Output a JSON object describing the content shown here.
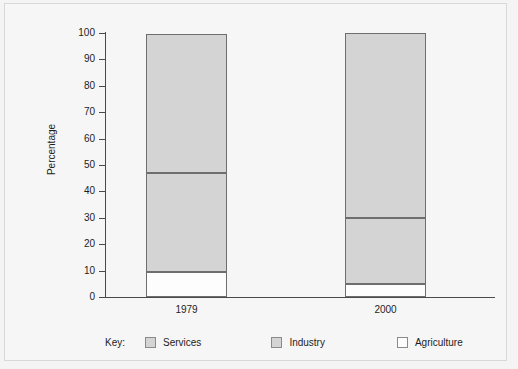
{
  "chart_data": {
    "type": "bar",
    "subtype": "stacked-bar",
    "title": "",
    "xlabel": "",
    "ylabel": "Percentage",
    "ylim": [
      0,
      100
    ],
    "yticks": [
      0,
      10,
      20,
      30,
      40,
      50,
      60,
      70,
      80,
      90,
      100
    ],
    "ytick_labels": [
      "0",
      "10",
      "20",
      "30",
      "40",
      "50",
      "60",
      "70",
      "80",
      "90",
      "100"
    ],
    "grid": false,
    "categories": [
      "1979",
      "2000"
    ],
    "legend_position": "bottom",
    "legend_title": "Key:",
    "series": [
      {
        "name": "Agriculture",
        "values": [
          9.5,
          5
        ],
        "color": "#fdfdfd"
      },
      {
        "name": "Industry",
        "values": [
          37.5,
          25
        ],
        "color": "#d4d4d4"
      },
      {
        "name": "Services",
        "values": [
          52.5,
          70
        ],
        "color": "#d4d4d4"
      }
    ],
    "cumulative_boundaries": {
      "1979": {
        "agriculture_top": 9.5,
        "industry_top": 47,
        "services_top": 99.5
      },
      "2000": {
        "agriculture_top": 5,
        "industry_top": 30,
        "services_top": 100
      }
    }
  },
  "legend": {
    "key_label": "Key:",
    "items": [
      {
        "label": "Services"
      },
      {
        "label": "Industry"
      },
      {
        "label": "Agriculture"
      }
    ]
  },
  "axis": {
    "y_title": "Percentage"
  }
}
